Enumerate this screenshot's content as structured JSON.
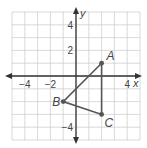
{
  "figure": {
    "type": "coordinate-plane",
    "grid": {
      "min": -5,
      "max": 5,
      "step": 1
    },
    "axes": {
      "x_label": "x",
      "y_label": "y",
      "x_ticks": [
        {
          "value": -4,
          "label": "−4"
        },
        {
          "value": -2,
          "label": "−2"
        },
        {
          "value": 4,
          "label": "4"
        }
      ],
      "y_ticks": [
        {
          "value": 4,
          "label": "4"
        },
        {
          "value": 2,
          "label": "2"
        },
        {
          "value": -4,
          "label": "−4"
        }
      ]
    },
    "points": [
      {
        "name": "A",
        "x": 2,
        "y": 1
      },
      {
        "name": "B",
        "x": -1,
        "y": -2
      },
      {
        "name": "C",
        "x": 2,
        "y": -3
      }
    ],
    "polygon": [
      "A",
      "B",
      "C"
    ],
    "colors": {
      "grid": "#d0d0d0",
      "axis": "#333333",
      "shape": "#555555",
      "labels": "#444444"
    }
  }
}
